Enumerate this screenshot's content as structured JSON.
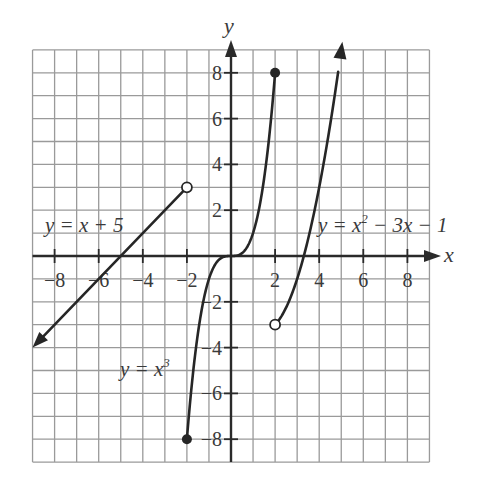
{
  "chart_data": {
    "type": "line",
    "title": "",
    "xlabel": "x",
    "ylabel": "y",
    "xlim": [
      -9,
      9
    ],
    "ylim": [
      -9,
      9
    ],
    "grid": true,
    "x_ticks": [
      "-8",
      "-6",
      "-4",
      "-2",
      "2",
      "4",
      "6",
      "8"
    ],
    "y_ticks": [
      "8",
      "6",
      "4",
      "2",
      "-2",
      "-4",
      "-6",
      "-8"
    ],
    "series": [
      {
        "name": "y = x + 5",
        "label_parts": {
          "lhs": "y",
          "eq": " = ",
          "rhs": "x + 5"
        },
        "domain": "x < -2",
        "x": [
          -9,
          -2
        ],
        "y": [
          -4,
          3
        ],
        "left_end": "arrow",
        "right_end": {
          "point": [
            -2,
            3
          ],
          "style": "open"
        }
      },
      {
        "name": "y = x^3",
        "label_parts": {
          "lhs": "y",
          "eq": " = ",
          "rhs": "x",
          "sup": "3"
        },
        "domain": "-2 <= x <= 2",
        "x": [
          -2,
          -1.5,
          -1,
          -0.5,
          0,
          0.5,
          1,
          1.5,
          2
        ],
        "y": [
          -8,
          -3.375,
          -1,
          -0.125,
          0,
          0.125,
          1,
          3.375,
          8
        ],
        "left_end": {
          "point": [
            -2,
            -8
          ],
          "style": "closed"
        },
        "right_end": {
          "point": [
            2,
            8
          ],
          "style": "closed"
        }
      },
      {
        "name": "y = x^2 - 3x - 1",
        "label_parts": {
          "lhs": "y",
          "eq": " = ",
          "rhs": "x",
          "sup": "2",
          "tail": " − 3x − 1"
        },
        "domain": "x > 2",
        "x": [
          2,
          2.5,
          3,
          3.5,
          4,
          4.5,
          5
        ],
        "y": [
          -3,
          -2.25,
          -1,
          0.75,
          3,
          5.75,
          9
        ],
        "left_end": {
          "point": [
            2,
            -3
          ],
          "style": "open"
        },
        "right_end": "arrow"
      }
    ],
    "annotations": [
      "y = x + 5",
      "y = x^3",
      "y = x^2 - 3x - 1"
    ]
  },
  "labels": {
    "x_axis": "x",
    "y_axis": "y",
    "line_eq": "y = x + 5",
    "cubic_eq_base": "y = x",
    "cubic_eq_sup": "3",
    "quad_eq_base": "y = x",
    "quad_eq_sup": "2",
    "quad_eq_tail": " − 3x − 1"
  }
}
